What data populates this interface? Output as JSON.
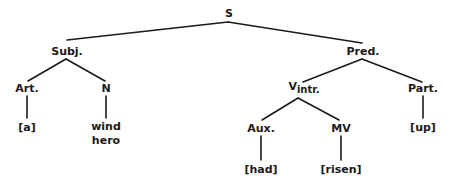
{
  "diagram": {
    "type": "syntax-tree",
    "line_color": "#1a1a1a",
    "nodes": {
      "root": {
        "label": "S"
      },
      "subject": {
        "label": "Subj."
      },
      "predicate": {
        "label": "Pred."
      },
      "article": {
        "label": "Art."
      },
      "noun": {
        "label": "N"
      },
      "verb": {
        "label": "V",
        "subscript": "intr."
      },
      "particle": {
        "label": "Part."
      },
      "auxiliary": {
        "label": "Aux."
      },
      "main_verb": {
        "label": "MV"
      }
    },
    "leaves": {
      "article": "[a]",
      "noun_line1": "wind",
      "noun_line2": "hero",
      "particle": "[up]",
      "auxiliary": "[had]",
      "main_verb": "[risen]"
    },
    "edges": [
      [
        "S",
        "Subj."
      ],
      [
        "S",
        "Pred."
      ],
      [
        "Subj.",
        "Art."
      ],
      [
        "Subj.",
        "N"
      ],
      [
        "Pred.",
        "Vintr."
      ],
      [
        "Pred.",
        "Part."
      ],
      [
        "Vintr.",
        "Aux."
      ],
      [
        "Vintr.",
        "MV"
      ],
      [
        "Art.",
        "[a]"
      ],
      [
        "N",
        "wind hero"
      ],
      [
        "Part.",
        "[up]"
      ],
      [
        "Aux.",
        "[had]"
      ],
      [
        "MV",
        "[risen]"
      ]
    ]
  }
}
